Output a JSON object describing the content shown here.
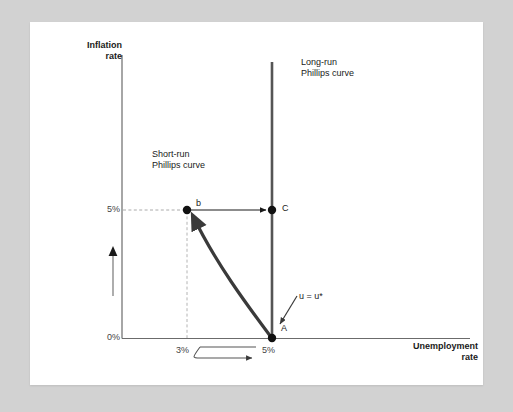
{
  "figure": {
    "title_axes": {
      "y_axis_title": "Inflation\nrate",
      "x_axis_title": "Unemployment\nrate"
    },
    "curve_labels": {
      "long_run": "Long-run\nPhillips curve",
      "short_run": "Short-run\nPhillips curve"
    },
    "ticks": {
      "y_upper": "5%",
      "y_lower": "0%",
      "x_left": "3%",
      "x_right": "5%"
    },
    "points": [
      {
        "name": "point-b",
        "label": "b",
        "x_value": "3%",
        "y_value": "5%"
      },
      {
        "name": "point-c",
        "label": "C",
        "x_value": "5%",
        "y_value": "5%"
      },
      {
        "name": "point-a",
        "label": "A",
        "x_value": "5%",
        "y_value": "0%"
      }
    ],
    "annotations": {
      "natural_rate": "u = u*"
    },
    "colors": {
      "background": "#d2d2d2",
      "card": "#ffffff",
      "axis": "#6b6b6b",
      "long_run_curve": "#555555",
      "short_run_curve": "#3a3a3a",
      "guide_dashed": "#aaaaaa",
      "text": "#1a1a1a"
    }
  }
}
